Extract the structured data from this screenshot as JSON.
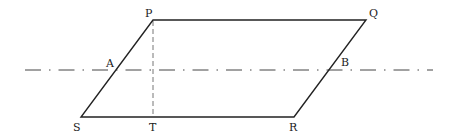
{
  "figure": {
    "type": "geometry-parallelogram-with-symmetry-line",
    "colors": {
      "stroke": "#222222",
      "dashed": "#555555"
    },
    "points": {
      "P": {
        "label": "P",
        "x": 153,
        "y": 20,
        "lx": 145,
        "ly": 17
      },
      "Q": {
        "label": "Q",
        "x": 366,
        "y": 20,
        "lx": 369,
        "ly": 17
      },
      "R": {
        "label": "R",
        "x": 294,
        "y": 117,
        "lx": 289,
        "ly": 131
      },
      "S": {
        "label": "S",
        "x": 81,
        "y": 117,
        "lx": 73,
        "ly": 131
      },
      "T": {
        "label": "T",
        "x": 153,
        "y": 117,
        "lx": 149,
        "ly": 131
      },
      "A": {
        "label": "A",
        "x": 116,
        "y": 70,
        "lx": 106,
        "ly": 67
      },
      "B": {
        "label": "B",
        "x": 329,
        "y": 70,
        "lx": 341,
        "ly": 66
      }
    },
    "lines": {
      "parallelogram": "PQRS",
      "dashed_altitude": "PT",
      "dash_dot_axis": {
        "y": 70,
        "x1": 25,
        "x2": 433
      }
    }
  }
}
